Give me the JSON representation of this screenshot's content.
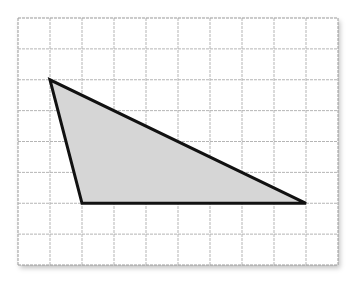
{
  "diagram": {
    "type": "triangle-on-grid",
    "grid": {
      "columns": 10,
      "rows": 8,
      "line_color": "#b5b5b5",
      "border_color": "#9a9a9a"
    },
    "shape": {
      "kind": "triangle",
      "vertices_grid": [
        [
          1,
          2
        ],
        [
          2,
          6
        ],
        [
          9,
          6
        ]
      ],
      "fill": "#d6d6d6",
      "stroke": "#111111",
      "stroke_width": 3
    }
  }
}
